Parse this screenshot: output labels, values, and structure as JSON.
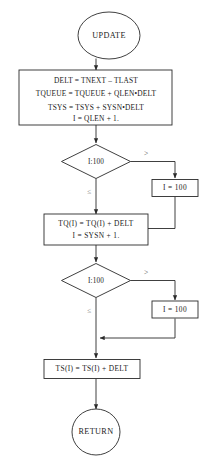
{
  "diagram": {
    "type": "flowchart",
    "colors": {
      "stroke": "#2a2a2a",
      "fill": "#ffffff",
      "text": "#1a1a1a",
      "label": "#555555"
    },
    "nodes": {
      "start": {
        "shape": "terminal",
        "label": "UPDATE"
      },
      "proc1": {
        "shape": "process",
        "lines": [
          "DELT = TNEXT – TLAST",
          "TQUEUE = TQUEUE + QLEN•DELT",
          "TSYS = TSYS + SYSN•DELT",
          "I = QLEN + 1."
        ]
      },
      "decision1": {
        "shape": "decision",
        "label": "I:100"
      },
      "clamp1": {
        "shape": "process",
        "label": "I = 100"
      },
      "proc2": {
        "shape": "process",
        "lines": [
          "TQ(I) = TQ(I) + DELT",
          "I = SYSN + 1."
        ]
      },
      "decision2": {
        "shape": "decision",
        "label": "I:100"
      },
      "clamp2": {
        "shape": "process",
        "label": "I = 100"
      },
      "proc3": {
        "shape": "process",
        "label": "TS(I) = TS(I) + DELT"
      },
      "end": {
        "shape": "terminal",
        "label": "RETURN"
      }
    },
    "edge_labels": {
      "d1_greater": ">",
      "d1_lessequal": "≤",
      "d2_greater": ">",
      "d2_lessequal": "≤"
    }
  }
}
